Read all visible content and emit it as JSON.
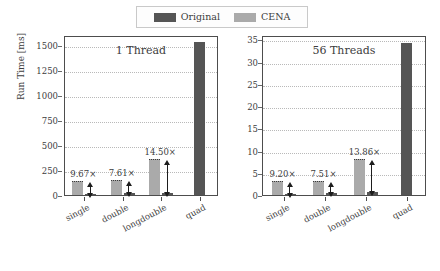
{
  "legend": {
    "entries": [
      {
        "label": "Original",
        "color": "#555555",
        "key": "original"
      },
      {
        "label": "CENA",
        "color": "#aaaaaa",
        "key": "cena"
      }
    ]
  },
  "axis": {
    "ylabel": "Run Time [ms]"
  },
  "chart_data": [
    {
      "type": "bar",
      "title": "1 Thread",
      "xlabel": "",
      "ylabel": "Run Time [ms]",
      "ylim": [
        0,
        1600
      ],
      "yticks": [
        0,
        250,
        500,
        750,
        1000,
        1250,
        1500
      ],
      "ytick_labels": [
        "0",
        "250",
        "500",
        "750",
        "1000",
        "1250",
        "1500"
      ],
      "grid": true,
      "legend_position": "above-figure",
      "categories": [
        "single",
        "double",
        "longdouble",
        "quad"
      ],
      "series": [
        {
          "name": "Original",
          "color": "#555555",
          "values": [
            14,
            18,
            24,
            1530
          ]
        },
        {
          "name": "CENA",
          "color": "#aaaaaa",
          "values": [
            135,
            137,
            348,
            0
          ]
        }
      ],
      "annotations": [
        {
          "category": "single",
          "text": "9.67×",
          "value": 9.67
        },
        {
          "category": "double",
          "text": "7.61×",
          "value": 7.61
        },
        {
          "category": "longdouble",
          "text": "14.50×",
          "value": 14.5
        }
      ]
    },
    {
      "type": "bar",
      "title": "56 Threads",
      "xlabel": "",
      "ylabel": "Run Time [ms]",
      "ylim": [
        0,
        36
      ],
      "yticks": [
        0,
        5,
        10,
        15,
        20,
        25,
        30,
        35
      ],
      "ytick_labels": [
        "0",
        "5",
        "10",
        "15",
        "20",
        "25",
        "30",
        "35"
      ],
      "grid": true,
      "legend_position": "above-figure",
      "categories": [
        "single",
        "double",
        "longdouble",
        "quad"
      ],
      "series": [
        {
          "name": "Original",
          "color": "#555555",
          "values": [
            0.32,
            0.38,
            0.57,
            34.2
          ]
        },
        {
          "name": "CENA",
          "color": "#aaaaaa",
          "values": [
            2.94,
            2.85,
            7.9,
            0
          ]
        }
      ],
      "annotations": [
        {
          "category": "single",
          "text": "9.20×",
          "value": 9.2
        },
        {
          "category": "double",
          "text": "7.51×",
          "value": 7.51
        },
        {
          "category": "longdouble",
          "text": "13.86×",
          "value": 13.86
        }
      ]
    }
  ]
}
